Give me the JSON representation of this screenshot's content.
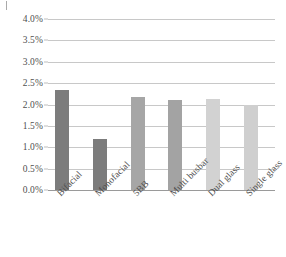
{
  "chart_data": {
    "type": "bar",
    "title": "",
    "subtitle": "",
    "xlabel": "",
    "ylabel": "",
    "categories": [
      "Bifacial",
      "Monofacial",
      "5BB",
      "Multi busbar",
      "Dual glass",
      "Single glass"
    ],
    "values": [
      2.35,
      1.2,
      2.17,
      2.1,
      2.12,
      2.0
    ],
    "value_unit": "%",
    "ylim": [
      0.0,
      4.0
    ],
    "ytick_labels": [
      "4.0%",
      "3.5%",
      "3.0%",
      "2.5%",
      "2.0%",
      "1.5%",
      "1.0%",
      "0.5%",
      "0.0%"
    ],
    "ytick_values": [
      4.0,
      3.5,
      3.0,
      2.5,
      2.0,
      1.5,
      1.0,
      0.5,
      0.0
    ],
    "grid": true,
    "grid_orientation": "horizontal",
    "legend": false,
    "legend_position": "none",
    "bar_colors": [
      "#7c7c7c",
      "#7c7c7c",
      "#a6a6a6",
      "#a3a3a3",
      "#d2d2d2",
      "#cfcfcf"
    ],
    "colors": {
      "grid": "#c8c8c8",
      "axis": "#9a9a9a",
      "text": "#4f4f4f",
      "background": "#ffffff",
      "group_dark": "#7c7c7c",
      "group_medium": "#a6a6a6",
      "group_light": "#d2d2d2"
    },
    "annotations": []
  }
}
